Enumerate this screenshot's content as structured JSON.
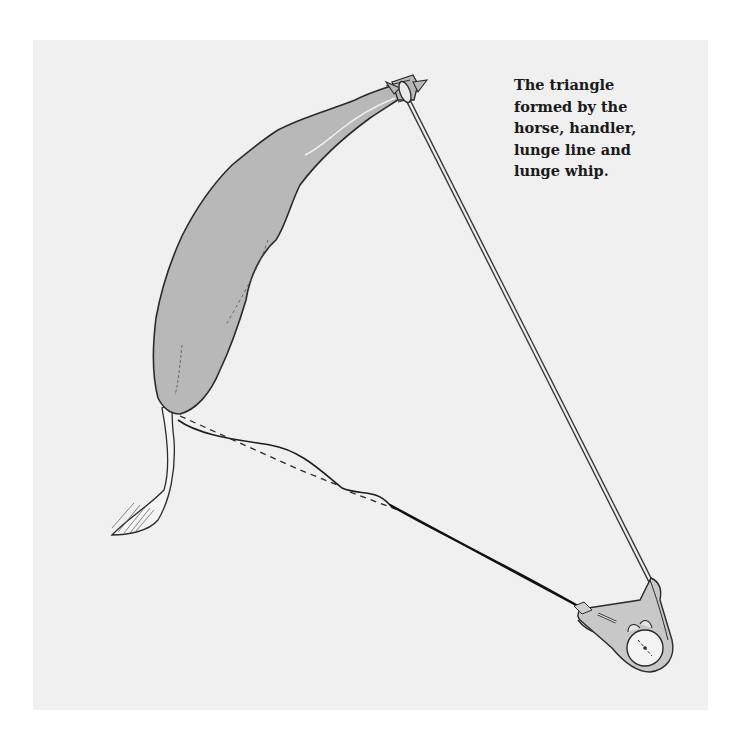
{
  "figure": {
    "caption_lines": [
      "The triangle",
      "formed by the",
      "horse, handler,",
      "lunge line and",
      "lunge whip."
    ],
    "elements": {
      "horse": "horse (top view)",
      "handler": "handler (top view)",
      "lunge_line": "lunge line",
      "lunge_whip": "lunge whip"
    },
    "colors": {
      "background": "#ffffff",
      "panel": "#f0f0f0",
      "horse_fill": "#b8b8b8",
      "outline": "#2a2a2a"
    }
  }
}
